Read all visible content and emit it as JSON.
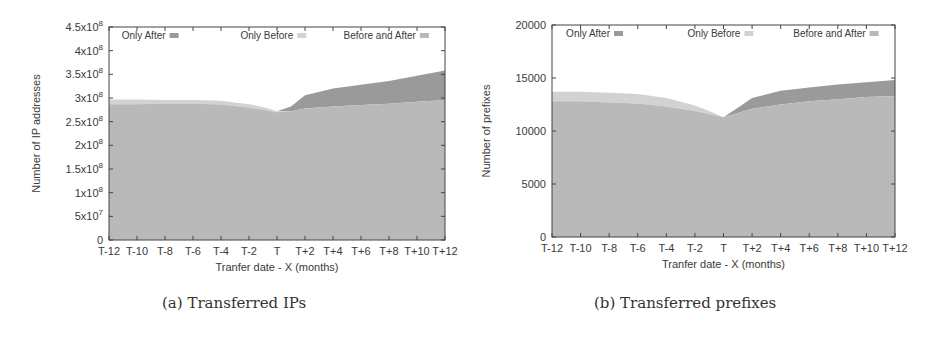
{
  "figure": {
    "captions": [
      "(a) Transferred IPs",
      "(b) Transferred prefixes"
    ]
  },
  "colors": {
    "only_after": "#9a9a9a",
    "only_before": "#d2d2d2",
    "before_and_after": "#b9b9b9",
    "axis": "#444444"
  },
  "chart_data": [
    {
      "type": "area",
      "stacked": true,
      "title": "",
      "caption": "(a) Transferred IPs",
      "xlabel": "Tranfer date - X (months)",
      "ylabel": "Number of IP addresses",
      "x_ticks": [
        "T-12",
        "T-10",
        "T-8",
        "T-6",
        "T-4",
        "T-2",
        "T",
        "T+2",
        "T+4",
        "T+6",
        "T+8",
        "T+10",
        "T+12"
      ],
      "y_ticks": [
        "0",
        "5x10^7",
        "1x10^8",
        "1.5x10^8",
        "2x10^8",
        "2.5x10^8",
        "3x10^8",
        "3.5x10^8",
        "4x10^8",
        "4.5x10^8"
      ],
      "y_tick_values": [
        0,
        50000000,
        100000000,
        150000000,
        200000000,
        250000000,
        300000000,
        350000000,
        400000000,
        450000000
      ],
      "ylim": [
        0,
        450000000
      ],
      "xlim": [
        -12,
        12
      ],
      "grid": false,
      "legend_position": "top, inside, horizontal",
      "x": [
        -12,
        -10,
        -8,
        -6,
        -4,
        -2,
        -1,
        0,
        1,
        2,
        4,
        6,
        8,
        10,
        12
      ],
      "series": [
        {
          "name": "Before and After",
          "values": [
            287000000,
            287000000,
            288000000,
            288000000,
            286000000,
            280000000,
            275000000,
            270000000,
            272000000,
            278000000,
            282000000,
            285000000,
            288000000,
            292000000,
            296000000
          ]
        },
        {
          "name": "Only Before",
          "values": [
            10000000,
            10000000,
            8000000,
            8000000,
            8000000,
            7000000,
            6000000,
            2000000,
            0,
            0,
            0,
            0,
            0,
            0,
            0
          ]
        },
        {
          "name": "Only After",
          "values": [
            0,
            0,
            0,
            0,
            0,
            0,
            0,
            0,
            10000000,
            28000000,
            38000000,
            43000000,
            48000000,
            55000000,
            62000000
          ]
        }
      ],
      "legend": [
        "Only After",
        "Only Before",
        "Before and After"
      ]
    },
    {
      "type": "area",
      "stacked": true,
      "title": "",
      "caption": "(b) Transferred prefixes",
      "xlabel": "Tranfer date - X (months)",
      "ylabel": "Number of prefixes",
      "x_ticks": [
        "T-12",
        "T-10",
        "T-8",
        "T-6",
        "T-4",
        "T-2",
        "T",
        "T+2",
        "T+4",
        "T+6",
        "T+8",
        "T+10",
        "T+12"
      ],
      "y_ticks": [
        "0",
        "5000",
        "10000",
        "15000",
        "20000"
      ],
      "y_tick_values": [
        0,
        5000,
        10000,
        15000,
        20000
      ],
      "ylim": [
        0,
        20000
      ],
      "xlim": [
        -12,
        12
      ],
      "grid": false,
      "legend_position": "top, inside, horizontal",
      "x": [
        -12,
        -10,
        -8,
        -6,
        -4,
        -2,
        -1,
        0,
        1,
        2,
        4,
        6,
        8,
        10,
        12
      ],
      "series": [
        {
          "name": "Before and After",
          "values": [
            12800,
            12800,
            12700,
            12600,
            12300,
            11900,
            11600,
            11300,
            11700,
            12100,
            12500,
            12800,
            13000,
            13200,
            13300
          ]
        },
        {
          "name": "Only Before",
          "values": [
            900,
            900,
            900,
            900,
            800,
            500,
            300,
            0,
            0,
            0,
            0,
            0,
            0,
            0,
            0
          ]
        },
        {
          "name": "Only After",
          "values": [
            0,
            0,
            0,
            0,
            0,
            0,
            0,
            0,
            500,
            1000,
            1300,
            1300,
            1400,
            1400,
            1500
          ]
        }
      ],
      "legend": [
        "Only After",
        "Only Before",
        "Before and After"
      ]
    }
  ]
}
